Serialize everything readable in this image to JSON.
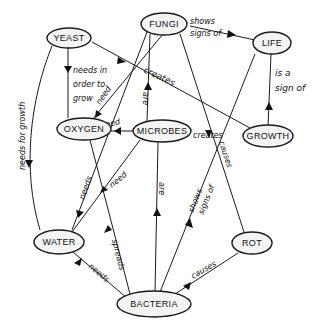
{
  "diagram": {
    "type": "concept-map",
    "nodes": [
      {
        "id": "yeast",
        "label": "YEAST"
      },
      {
        "id": "fungi",
        "label": "FUNGI"
      },
      {
        "id": "life",
        "label": "LIFE"
      },
      {
        "id": "oxygen",
        "label": "OXYGEN"
      },
      {
        "id": "microbes",
        "label": "MICROBES"
      },
      {
        "id": "growth",
        "label": "GROWTH"
      },
      {
        "id": "water",
        "label": "WATER"
      },
      {
        "id": "rot",
        "label": "ROT"
      },
      {
        "id": "bacteria",
        "label": "BACTERIA"
      }
    ],
    "edges": [
      {
        "from": "yeast",
        "to": "oxygen",
        "label": "needs in order to grow",
        "label_lines": [
          "needs in",
          "order to",
          "grow"
        ]
      },
      {
        "from": "yeast",
        "to": "water",
        "label": "needs for growth"
      },
      {
        "from": "yeast",
        "to": "growth",
        "label": "creates"
      },
      {
        "from": "fungi",
        "to": "life",
        "label": "shows signs of",
        "label_lines": [
          "shows",
          "signs of"
        ]
      },
      {
        "from": "fungi",
        "to": "oxygen",
        "label": "need"
      },
      {
        "from": "fungi",
        "to": "water",
        "label": "needs"
      },
      {
        "from": "fungi",
        "to": "rot",
        "label": "causes"
      },
      {
        "from": "growth",
        "to": "life",
        "label": "is a sign of",
        "label_lines": [
          "is a",
          "sign of"
        ]
      },
      {
        "from": "microbes",
        "to": "fungi",
        "label": "are"
      },
      {
        "from": "microbes",
        "to": "oxygen",
        "label": "need"
      },
      {
        "from": "microbes",
        "to": "growth",
        "label": "creates"
      },
      {
        "from": "microbes",
        "to": "water",
        "label": "need"
      },
      {
        "from": "bacteria",
        "to": "microbes",
        "label": "are"
      },
      {
        "from": "bacteria",
        "to": "water",
        "label": "needs"
      },
      {
        "from": "bacteria",
        "to": "oxygen",
        "label": "spreads"
      },
      {
        "from": "bacteria",
        "to": "life",
        "label": "shows signs of",
        "label_lines": [
          "shows",
          "signs of"
        ]
      },
      {
        "from": "bacteria",
        "to": "rot",
        "label": "causes"
      }
    ]
  }
}
